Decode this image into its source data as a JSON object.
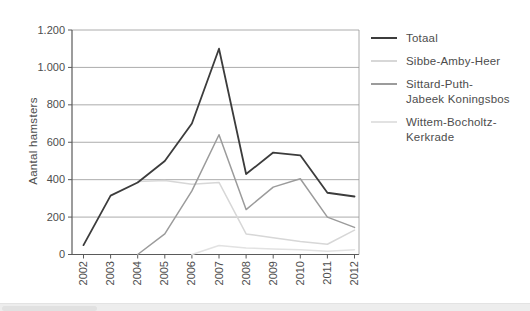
{
  "chart_data": {
    "type": "line",
    "title": "",
    "ylabel": "Aantal hamsters",
    "xlabel": "",
    "categories": [
      "2002",
      "2003",
      "2004",
      "2005",
      "2006",
      "2007",
      "2008",
      "2009",
      "2010",
      "2011",
      "2012"
    ],
    "ylim": [
      0,
      1200
    ],
    "ytick_interval": 200,
    "ytick_labels": [
      "0",
      "200",
      "400",
      "600",
      "800",
      "1.000",
      "1.200"
    ],
    "grid": "horizontal",
    "legend_position": "right",
    "series": [
      {
        "name": "Totaal",
        "legend_lines": [
          "Totaal"
        ],
        "color": "#3c3c3c",
        "line_width": 1.8,
        "values": [
          50,
          315,
          385,
          500,
          700,
          1100,
          430,
          545,
          530,
          330,
          310
        ]
      },
      {
        "name": "Sibbe-Amby-Heer",
        "legend_lines": [
          "Sibbe-Amby-Heer"
        ],
        "color": "#d7d7d7",
        "line_width": 1.5,
        "values": [
          null,
          null,
          390,
          395,
          375,
          385,
          110,
          90,
          70,
          55,
          130
        ]
      },
      {
        "name": "Sittard-Puth-Jabeek Koningsbos",
        "legend_lines": [
          "Sittard-Puth-",
          "Jabeek Koningsbos"
        ],
        "color": "#9b9b9b",
        "line_width": 1.5,
        "values": [
          null,
          null,
          0,
          110,
          340,
          640,
          240,
          360,
          405,
          200,
          145
        ]
      },
      {
        "name": "Wittem-Bocholtz-Kerkrade",
        "legend_lines": [
          "Wittem-Bocholtz-",
          "Kerkrade"
        ],
        "color": "#e2e2e2",
        "line_width": 1.5,
        "values": [
          null,
          null,
          null,
          null,
          0,
          48,
          35,
          30,
          25,
          18,
          25
        ]
      }
    ]
  }
}
